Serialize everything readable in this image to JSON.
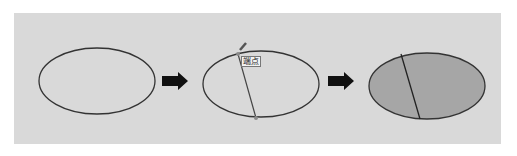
{
  "diagram": {
    "steps": [
      {
        "id": "ellipse",
        "description": "Plain ellipse outline"
      },
      {
        "id": "split-line",
        "description": "Line drawn across ellipse between endpoints",
        "label": "端点"
      },
      {
        "id": "filled",
        "description": "Ellipse filled grey with dividing line"
      }
    ],
    "colors": {
      "panel": "#d9d9d9",
      "stroke": "#333333",
      "fill": "#a6a6a6",
      "arrow": "#111111",
      "endpoint": "#8a8a8a"
    }
  }
}
